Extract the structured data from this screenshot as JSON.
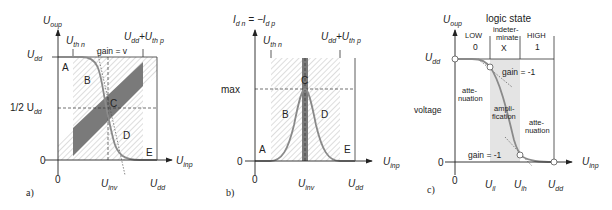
{
  "panels": {
    "a": {
      "tag": "a)",
      "y_axis": {
        "main": "U",
        "sub": "oup"
      },
      "x_axis": {
        "main": "U",
        "sub": "inp"
      },
      "y_ticks": {
        "udd_main": "U",
        "udd_sub": "dd",
        "half": "1/2 U",
        "half_sub": "dd",
        "zero": "0"
      },
      "x_ticks": {
        "zero": "0",
        "inv_main": "U",
        "inv_sub": "inv",
        "udd_main": "U",
        "udd_sub": "dd"
      },
      "top_labels": {
        "thn_main": "U",
        "thn_sub": "th n",
        "sum_main": "U",
        "sum_sub1": "dd",
        "plus": "+U",
        "sum_sub2": "th p"
      },
      "gain_label": "gain = v",
      "regions": [
        "A",
        "B",
        "C",
        "D",
        "E"
      ]
    },
    "b": {
      "tag": "b)",
      "y_axis": {
        "main1": "I",
        "sub1": "d n",
        "eq": " = −I",
        "sub2": "d p"
      },
      "x_axis": {
        "main": "U",
        "sub": "inp"
      },
      "y_ticks": {
        "max": "max",
        "zero": "0"
      },
      "x_ticks": {
        "zero": "0",
        "inv_main": "U",
        "inv_sub": "inv",
        "udd_main": "U",
        "udd_sub": "dd"
      },
      "top_labels": {
        "thn_main": "U",
        "thn_sub": "th n",
        "sum_main": "U",
        "sum_sub1": "dd",
        "plus": "+U",
        "sum_sub2": "th p"
      },
      "regions": [
        "A",
        "B",
        "C",
        "D",
        "E"
      ]
    },
    "c": {
      "tag": "c)",
      "y_axis": {
        "main": "U",
        "sub": "oup"
      },
      "x_axis": {
        "main": "U",
        "sub": "inp"
      },
      "y_ticks": {
        "udd_main": "U",
        "udd_sub": "dd",
        "zero": "0",
        "voltage": "voltage"
      },
      "x_ticks": {
        "zero": "0",
        "il_main": "U",
        "il_sub": "il",
        "ih_main": "U",
        "ih_sub": "ih",
        "udd_main": "U",
        "udd_sub": "dd"
      },
      "logic_state": "logic state",
      "states": [
        {
          "name": "LOW",
          "value": "0"
        },
        {
          "name1": "indeter-",
          "name2": "minate",
          "value": "X"
        },
        {
          "name": "HIGH",
          "value": "1"
        }
      ],
      "gain_top": "gain = -1",
      "gain_bottom": "gain = -1",
      "attenuation_left": [
        "atte-",
        "nuation"
      ],
      "amplification": [
        "ampli-",
        "fication"
      ],
      "attenuation_right": [
        "atte-",
        "nuation"
      ]
    }
  },
  "colors": {
    "curve": "#8a8a8a",
    "shade": "#7a7a7a",
    "light_shade": "#e4e4e4",
    "axis": "#222222"
  }
}
